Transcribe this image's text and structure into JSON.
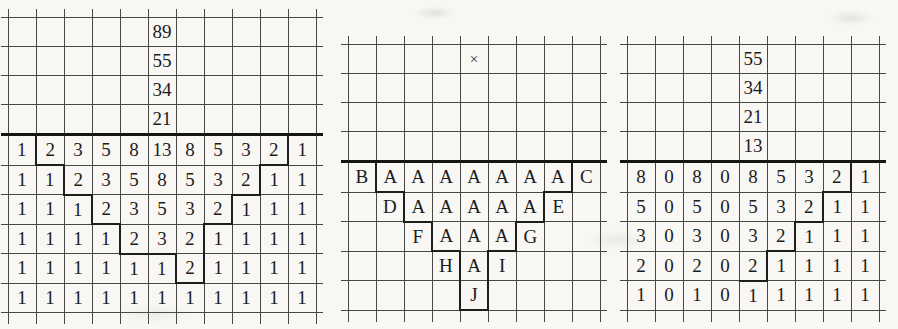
{
  "page": {
    "bg": "#f8f7f4",
    "line_color": "#474747",
    "separator_color": "#151515",
    "bold_line_color": "#1e1e1e",
    "ink_color": "#1c1c1c"
  },
  "symbols": {
    "multiply_sign": "×"
  },
  "grids": [
    {
      "name": "fibonacci-triangle-grid",
      "left": 1,
      "top": 9,
      "cols": 11,
      "header_rows": [
        [
          "",
          "",
          "",
          "",
          "",
          "89",
          "",
          "",
          "",
          "",
          ""
        ],
        [
          "",
          "",
          "",
          "",
          "",
          "55",
          "",
          "",
          "",
          "",
          ""
        ],
        [
          "",
          "",
          "",
          "",
          "",
          "34",
          "",
          "",
          "",
          "",
          ""
        ],
        [
          "",
          "",
          "",
          "",
          "",
          "21",
          "",
          "",
          "",
          "",
          ""
        ]
      ],
      "body_rows": [
        [
          "1",
          "2",
          "3",
          "5",
          "8",
          "13",
          "8",
          "5",
          "3",
          "2",
          "1"
        ],
        [
          "1",
          "1",
          "2",
          "3",
          "5",
          "8",
          "5",
          "3",
          "2",
          "1",
          "1"
        ],
        [
          "1",
          "1",
          "1",
          "2",
          "3",
          "5",
          "3",
          "2",
          "1",
          "1",
          "1"
        ],
        [
          "1",
          "1",
          "1",
          "1",
          "2",
          "3",
          "2",
          "1",
          "1",
          "1",
          "1"
        ],
        [
          "1",
          "1",
          "1",
          "1",
          "1",
          "1",
          "2",
          "1",
          "1",
          "1",
          "1"
        ],
        [
          "1",
          "1",
          "1",
          "1",
          "1",
          "1",
          "1",
          "1",
          "1",
          "1",
          "1"
        ]
      ],
      "bold_cells": {
        "0,1": "bl bb",
        "1,2": "bl bb",
        "2,3": "bl bb",
        "3,4": "bl bb",
        "3,5": "bb",
        "4,6": "bl br bb",
        "0,9": "br bb",
        "1,8": "br bb",
        "2,7": "br bb",
        "3,6": "br"
      }
    },
    {
      "name": "letter-triangle-grid",
      "left": 341,
      "top": 36,
      "cols": 9,
      "header_rows": [
        [
          "",
          "",
          "",
          "",
          "×",
          "",
          "",
          "",
          ""
        ],
        [
          "",
          "",
          "",
          "",
          "",
          "",
          "",
          "",
          ""
        ],
        [
          "",
          "",
          "",
          "",
          "",
          "",
          "",
          "",
          ""
        ],
        [
          "",
          "",
          "",
          "",
          "",
          "",
          "",
          "",
          ""
        ]
      ],
      "body_rows": [
        [
          "B",
          "A",
          "A",
          "A",
          "A",
          "A",
          "A",
          "A",
          "C"
        ],
        [
          "",
          "D",
          "A",
          "A",
          "A",
          "A",
          "A",
          "E",
          ""
        ],
        [
          "",
          "",
          "F",
          "A",
          "A",
          "A",
          "G",
          "",
          ""
        ],
        [
          "",
          "",
          "",
          "H",
          "A",
          "I",
          "",
          "",
          ""
        ],
        [
          "",
          "",
          "",
          "",
          "J",
          "",
          "",
          "",
          ""
        ]
      ],
      "bold_cells": {
        "0,1": "bl bb",
        "1,2": "bl bb",
        "2,3": "bl bb",
        "3,4": "bl br",
        "4,4": "bl br bb",
        "0,7": "br bb",
        "1,6": "br bb",
        "2,5": "br bb"
      }
    },
    {
      "name": "decomposition-grid",
      "left": 620,
      "top": 36,
      "cols": 9,
      "header_rows": [
        [
          "",
          "",
          "",
          "",
          "55",
          "",
          "",
          "",
          ""
        ],
        [
          "",
          "",
          "",
          "",
          "34",
          "",
          "",
          "",
          ""
        ],
        [
          "",
          "",
          "",
          "",
          "21",
          "",
          "",
          "",
          ""
        ],
        [
          "",
          "",
          "",
          "",
          "13",
          "",
          "",
          "",
          ""
        ]
      ],
      "body_rows": [
        [
          "8",
          "0",
          "8",
          "0",
          "8",
          "5",
          "3",
          "2",
          "1"
        ],
        [
          "5",
          "0",
          "5",
          "0",
          "5",
          "3",
          "2",
          "1",
          "1"
        ],
        [
          "3",
          "0",
          "3",
          "0",
          "3",
          "2",
          "1",
          "1",
          "1"
        ],
        [
          "2",
          "0",
          "2",
          "0",
          "2",
          "1",
          "1",
          "1",
          "1"
        ],
        [
          "1",
          "0",
          "1",
          "0",
          "1",
          "1",
          "1",
          "1",
          "1"
        ]
      ],
      "bold_cells": {
        "0,7": "br bb",
        "1,6": "br bb",
        "2,5": "br bb",
        "3,4": "br bb"
      }
    }
  ]
}
